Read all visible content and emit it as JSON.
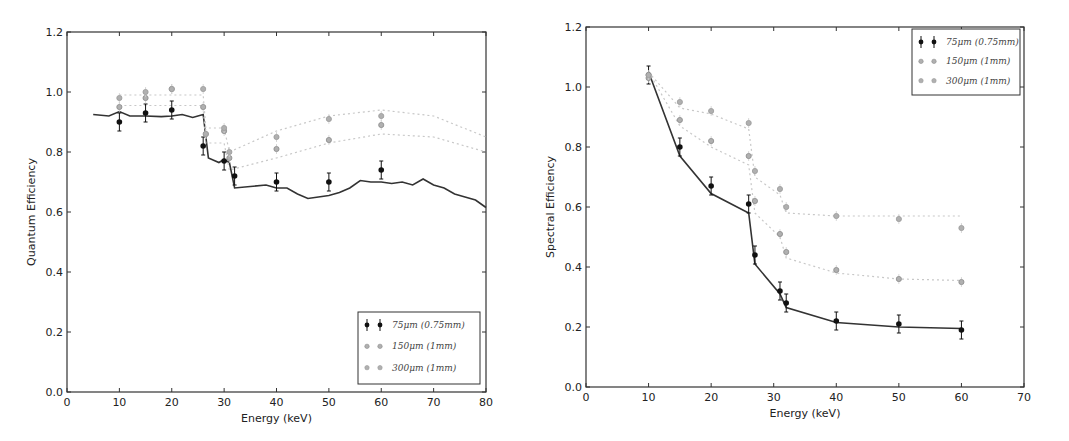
{
  "chart_data": [
    {
      "type": "line",
      "title": "",
      "xlabel": "Energy (keV)",
      "ylabel": "Quantum Efficiency",
      "xlim": [
        0,
        80
      ],
      "ylim": [
        0.0,
        1.2
      ],
      "xticks": [
        "0",
        "10",
        "20",
        "30",
        "40",
        "50",
        "60",
        "70",
        "80"
      ],
      "yticks": [
        "0.0",
        "0.2",
        "0.4",
        "0.6",
        "0.8",
        "1.0",
        "1.2"
      ],
      "grid": false,
      "legend_position": "lower right",
      "legend": [
        "75μm (0.75mm)",
        "150μm (1mm)",
        "300μm (1mm)"
      ],
      "series": [
        {
          "name": "75μm (0.75mm)",
          "kind": "measured",
          "x": [
            10,
            15,
            20,
            26,
            30,
            32,
            40,
            50,
            60
          ],
          "values": [
            0.9,
            0.93,
            0.94,
            0.82,
            0.77,
            0.72,
            0.7,
            0.7,
            0.74
          ]
        },
        {
          "name": "150μm (1mm)",
          "kind": "measured",
          "x": [
            10,
            15,
            20,
            26,
            26.5,
            30,
            31,
            40,
            50,
            60
          ],
          "values": [
            0.95,
            0.98,
            1.01,
            0.95,
            0.86,
            0.87,
            0.78,
            0.81,
            0.84,
            0.89
          ]
        },
        {
          "name": "300μm (1mm)",
          "kind": "measured",
          "x": [
            10,
            15,
            20,
            26,
            26.5,
            30,
            31,
            40,
            50,
            60
          ],
          "values": [
            0.98,
            1.0,
            1.01,
            1.01,
            0.86,
            0.88,
            0.8,
            0.85,
            0.91,
            0.92
          ]
        },
        {
          "name": "75μm simulated",
          "kind": "line",
          "x": [
            5,
            8,
            10,
            12,
            15,
            18,
            20,
            22,
            24,
            26,
            27,
            29,
            30,
            31,
            32,
            35,
            38,
            40,
            42,
            44,
            46,
            48,
            50,
            52,
            54,
            56,
            58,
            60,
            62,
            64,
            66,
            68,
            70,
            72,
            74,
            76,
            78,
            80
          ],
          "values": [
            0.925,
            0.92,
            0.935,
            0.92,
            0.92,
            0.918,
            0.92,
            0.925,
            0.915,
            0.925,
            0.78,
            0.765,
            0.775,
            0.765,
            0.68,
            0.685,
            0.69,
            0.68,
            0.68,
            0.66,
            0.645,
            0.65,
            0.655,
            0.665,
            0.68,
            0.705,
            0.7,
            0.7,
            0.695,
            0.7,
            0.69,
            0.71,
            0.69,
            0.68,
            0.66,
            0.65,
            0.64,
            0.615
          ]
        },
        {
          "name": "150μm simulated",
          "kind": "dotted",
          "x": [
            10,
            20,
            26,
            26.5,
            30,
            31,
            40,
            50,
            60,
            70,
            80
          ],
          "values": [
            0.955,
            0.955,
            0.955,
            0.83,
            0.83,
            0.74,
            0.78,
            0.83,
            0.86,
            0.85,
            0.8
          ]
        },
        {
          "name": "300μm simulated",
          "kind": "dotted",
          "x": [
            10,
            20,
            26,
            26.5,
            30,
            31,
            40,
            50,
            60,
            70,
            80
          ],
          "values": [
            0.99,
            0.99,
            0.99,
            0.88,
            0.88,
            0.8,
            0.87,
            0.92,
            0.94,
            0.92,
            0.85
          ]
        }
      ]
    },
    {
      "type": "line",
      "title": "",
      "xlabel": "Energy (keV)",
      "ylabel": "Spectral Efficiency",
      "xlim": [
        0,
        70
      ],
      "ylim": [
        0.0,
        1.2
      ],
      "xticks": [
        "0",
        "10",
        "20",
        "30",
        "40",
        "50",
        "60",
        "70"
      ],
      "yticks": [
        "0.0",
        "0.2",
        "0.4",
        "0.6",
        "0.8",
        "1.0",
        "1.2"
      ],
      "grid": false,
      "legend_position": "upper right",
      "legend": [
        "75μm (0.75mm)",
        "150μm (1mm)",
        "300μm (1mm)"
      ],
      "series": [
        {
          "name": "75μm (0.75mm)",
          "kind": "measured",
          "x": [
            10,
            15,
            20,
            26,
            27,
            31,
            32,
            40,
            50,
            60
          ],
          "values": [
            1.04,
            0.8,
            0.67,
            0.61,
            0.44,
            0.32,
            0.28,
            0.22,
            0.21,
            0.19
          ]
        },
        {
          "name": "150μm (1mm)",
          "kind": "measured",
          "x": [
            10,
            15,
            20,
            26,
            27,
            31,
            32,
            40,
            50,
            60
          ],
          "values": [
            1.03,
            0.89,
            0.82,
            0.77,
            0.62,
            0.51,
            0.45,
            0.39,
            0.36,
            0.35
          ]
        },
        {
          "name": "300μm (1mm)",
          "kind": "measured",
          "x": [
            10,
            15,
            20,
            26,
            27,
            31,
            32,
            40,
            50,
            60
          ],
          "values": [
            1.04,
            0.95,
            0.92,
            0.88,
            0.72,
            0.66,
            0.6,
            0.57,
            0.56,
            0.53
          ]
        },
        {
          "name": "75μm simulated",
          "kind": "line",
          "x": [
            10,
            15,
            20,
            26,
            27,
            31,
            32,
            40,
            50,
            60
          ],
          "values": [
            1.05,
            0.77,
            0.645,
            0.58,
            0.41,
            0.31,
            0.265,
            0.215,
            0.2,
            0.195
          ]
        },
        {
          "name": "150μm simulated",
          "kind": "dotted",
          "x": [
            10,
            15,
            20,
            26,
            27,
            31,
            32,
            40,
            50,
            60
          ],
          "values": [
            1.05,
            0.87,
            0.8,
            0.74,
            0.58,
            0.5,
            0.43,
            0.38,
            0.36,
            0.355
          ]
        },
        {
          "name": "300μm simulated",
          "kind": "dotted",
          "x": [
            10,
            15,
            20,
            26,
            27,
            31,
            32,
            40,
            50,
            60
          ],
          "values": [
            1.05,
            0.93,
            0.91,
            0.86,
            0.7,
            0.64,
            0.58,
            0.57,
            0.57,
            0.57
          ]
        }
      ]
    }
  ],
  "colors": {
    "measured_75": "#111111",
    "measured_150": "#8a8a8a",
    "measured_300": "#9a9a9a",
    "sim_line": "#333333",
    "dotted": "#c8c8c8",
    "axis": "#333333"
  }
}
